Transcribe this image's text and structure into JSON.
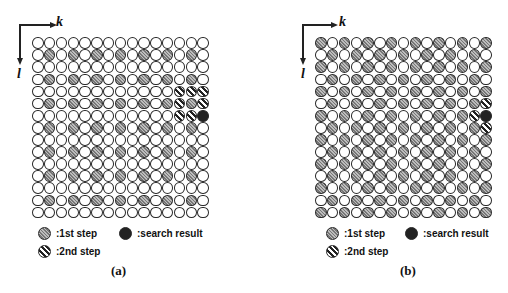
{
  "figure": {
    "axes": {
      "horizontal_label": "k",
      "vertical_label": "l"
    },
    "grid": {
      "rows": 15,
      "cols": 15
    },
    "legend": {
      "first_step": ":1st step",
      "second_step": ":2nd step",
      "search_result": ":search result"
    },
    "panels": [
      {
        "caption": "(a)",
        "first_step_pattern": "odd rows and odd columns",
        "second_step_cells": [
          [
            4,
            12
          ],
          [
            4,
            13
          ],
          [
            4,
            14
          ],
          [
            5,
            12
          ],
          [
            5,
            14
          ],
          [
            6,
            12
          ],
          [
            6,
            13
          ]
        ],
        "search_result_cell": [
          6,
          14
        ]
      },
      {
        "caption": "(b)",
        "first_step_pattern": "checkerboard (row+col even)",
        "second_step_cells": [
          [
            5,
            14
          ],
          [
            6,
            13
          ],
          [
            7,
            14
          ]
        ],
        "search_result_cell": [
          6,
          14
        ]
      }
    ]
  }
}
